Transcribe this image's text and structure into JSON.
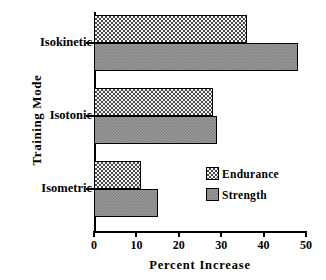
{
  "chart_data": {
    "type": "bar",
    "orientation": "horizontal",
    "title": "",
    "xlabel": "Percent  Increase",
    "ylabel": "Training  Mode",
    "categories": [
      "Isokinetic",
      "Isotonic",
      "Isometric"
    ],
    "series": [
      {
        "name": "Endurance",
        "values": [
          36,
          28,
          11
        ],
        "fill": "stipple-dots",
        "color": "#f2f2f2"
      },
      {
        "name": "Strength",
        "values": [
          48,
          29,
          15
        ],
        "fill": "solid-gray",
        "color": "#9a9a9a"
      }
    ],
    "xlim": [
      0,
      50
    ],
    "xticks": [
      0,
      10,
      20,
      30,
      40,
      50
    ],
    "xticklabels": [
      "0",
      "10",
      "20",
      "30",
      "40",
      "50"
    ],
    "grid": false,
    "legend_position": "center-right",
    "legend_entries": [
      "Endurance",
      "Strength"
    ]
  }
}
